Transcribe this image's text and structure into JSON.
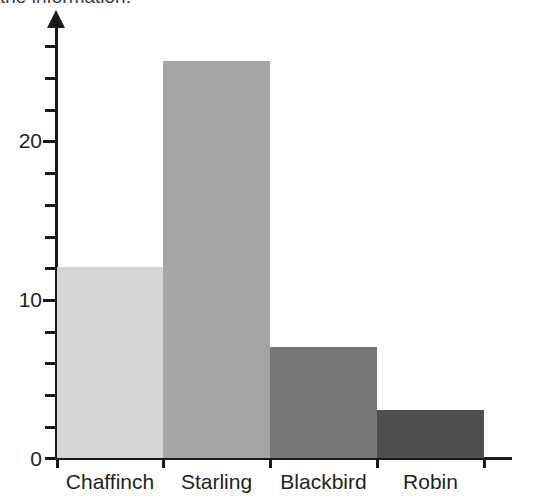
{
  "heading": {
    "text": "the information."
  },
  "chart_data": {
    "type": "bar",
    "title": "",
    "subtitle": "",
    "xlabel": "",
    "ylabel": "",
    "categories": [
      "Chaffinch",
      "Starling",
      "Blackbird",
      "Robin"
    ],
    "values": [
      12,
      25,
      7,
      3
    ],
    "series": [
      {
        "name": "Number of birds",
        "values": [
          12,
          25,
          7,
          3
        ]
      }
    ],
    "ylim": [
      0,
      27
    ],
    "ytick_labels": [
      "0",
      "10",
      "20"
    ],
    "ytick_values": [
      0,
      10,
      20
    ],
    "yminor_step": 2,
    "grid": false,
    "legend": "none",
    "bar_colors": [
      "#d5d5d5",
      "#a5a5a5",
      "#767676",
      "#4f4f4f"
    ],
    "axis_color": "#1a1a1a",
    "background": "#ffffff",
    "annotations": []
  }
}
